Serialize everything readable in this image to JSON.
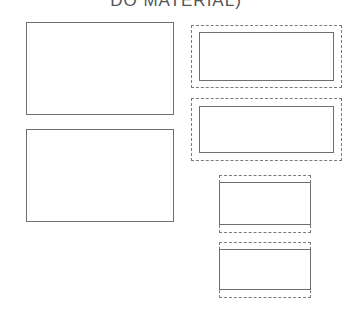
{
  "diagram": {
    "title": "DO MATERIAL)",
    "stroke_color": "#6e6e6e",
    "left_column": {
      "boxes": [
        {
          "label": "",
          "style": "solid"
        },
        {
          "label": "",
          "style": "solid"
        }
      ]
    },
    "right_column": {
      "groups": [
        {
          "outer": "dashed",
          "inner": "solid"
        },
        {
          "outer": "dashed",
          "inner": "solid"
        },
        {
          "outer": "dashed-open-sides",
          "inner": "solid"
        },
        {
          "outer": "dashed-open-sides",
          "inner": "solid"
        }
      ]
    }
  }
}
